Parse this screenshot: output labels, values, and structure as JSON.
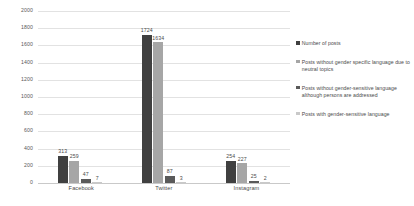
{
  "chart_data": {
    "type": "bar",
    "title": "",
    "subtitle": "",
    "xlabel": "",
    "ylabel": "",
    "categories": [
      "Facebook",
      "Twitter",
      "Instagram"
    ],
    "series": [
      {
        "name": "Number of posts",
        "color": "#404040",
        "values": [
          313,
          1724,
          254
        ]
      },
      {
        "name": "Posts without gender specific language due to neutral topics",
        "color": "#a6a6a6",
        "values": [
          259,
          1634,
          227
        ]
      },
      {
        "name": "Posts without gender-sensitive language although persons are addressed",
        "color": "#5a5a5a",
        "values": [
          47,
          87,
          25
        ]
      },
      {
        "name": "Posts with gender-sensitive language",
        "color": "#c9c9c9",
        "values": [
          7,
          3,
          2
        ]
      }
    ],
    "ylim": [
      0,
      2000
    ],
    "yticks": [
      0,
      200,
      400,
      600,
      800,
      1000,
      1200,
      1400,
      1600,
      1800,
      2000
    ],
    "ytick_labels": [
      "0",
      "200",
      "400",
      "600",
      "800",
      "1000",
      "1200",
      "1400",
      "1600",
      "1800",
      "2000"
    ],
    "grid": true,
    "legend_position": "right"
  },
  "legend": {
    "items": [
      {
        "label": "Number of posts"
      },
      {
        "label": "Posts without gender specific language due to neutral topics"
      },
      {
        "label": "Posts without gender-sensitive language although persons are addressed"
      },
      {
        "label": "Posts with gender-sensitive language"
      }
    ]
  }
}
